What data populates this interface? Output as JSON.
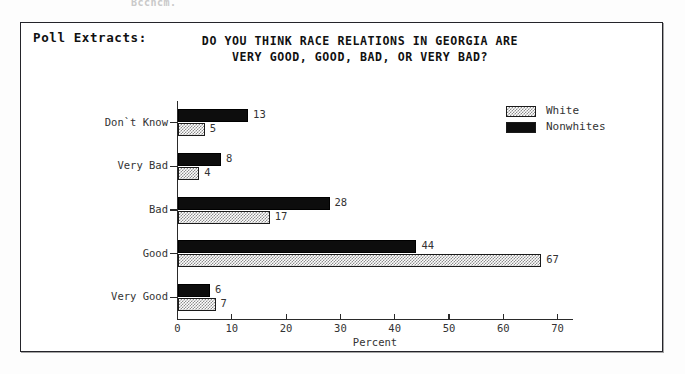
{
  "page": {
    "ghost_text": "Bccncm."
  },
  "figure": {
    "section_label": "Poll Extracts:",
    "title": "DO YOU THINK RACE RELATIONS IN GEORGIA ARE\nVERY GOOD, GOOD, BAD, OR VERY BAD?"
  },
  "legend": {
    "position": "top-right",
    "items": [
      {
        "label": "White",
        "swatch": "checkered-gray",
        "color": "#8d8d8d"
      },
      {
        "label": "Nonwhites",
        "swatch": "solid-black",
        "color": "#0d0d0d"
      }
    ]
  },
  "axes": {
    "x_title": "Percent",
    "x_ticks": [
      "0",
      "10",
      "20",
      "30",
      "40",
      "50",
      "60",
      "70"
    ],
    "y_ticks": [
      "Very Good",
      "Good",
      "Bad",
      "Very Bad",
      "Don`t Know"
    ]
  },
  "chart_data": {
    "type": "bar",
    "orientation": "horizontal",
    "title": "DO YOU THINK RACE RELATIONS IN GEORGIA ARE VERY GOOD, GOOD, BAD, OR VERY BAD?",
    "xlabel": "Percent",
    "ylabel": "",
    "xlim": [
      0,
      73
    ],
    "grid": false,
    "legend_position": "top-right",
    "categories": [
      "Very Good",
      "Good",
      "Bad",
      "Very Bad",
      "Don`t Know"
    ],
    "series": [
      {
        "name": "White",
        "color": "#8d8d8d",
        "values": [
          7,
          67,
          17,
          4,
          5
        ]
      },
      {
        "name": "Nonwhites",
        "color": "#0d0d0d",
        "values": [
          6,
          44,
          28,
          8,
          13
        ]
      }
    ],
    "data_labels": {
      "White": [
        "7",
        "67",
        "17",
        "4",
        "5"
      ],
      "Nonwhites": [
        "6",
        "44",
        "28",
        "8",
        "13"
      ]
    }
  }
}
